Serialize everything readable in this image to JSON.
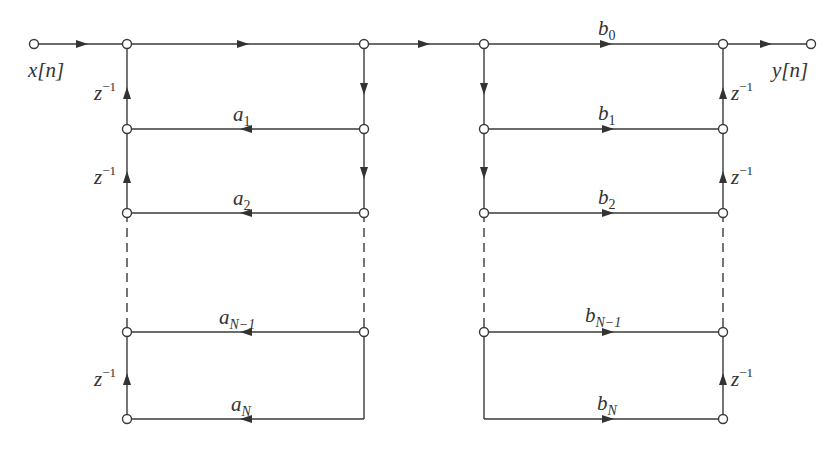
{
  "diagram": {
    "type": "signal-flow-graph",
    "title": "",
    "input_label": "x[n]",
    "output_label": "y[n]",
    "delay_label": {
      "base": "z",
      "exp": "−1"
    },
    "feedback_coefficients": [
      {
        "base": "a",
        "sub": "1"
      },
      {
        "base": "a",
        "sub": "2"
      },
      {
        "base": "a",
        "sub": "N−1"
      },
      {
        "base": "a",
        "sub": "N"
      }
    ],
    "feedforward_coefficients": [
      {
        "base": "b",
        "sub": "0"
      },
      {
        "base": "b",
        "sub": "1"
      },
      {
        "base": "b",
        "sub": "2"
      },
      {
        "base": "b",
        "sub": "N−1"
      },
      {
        "base": "b",
        "sub": "N"
      }
    ],
    "colors": {
      "line": "#3a3a3a",
      "background": "#ffffff"
    }
  }
}
